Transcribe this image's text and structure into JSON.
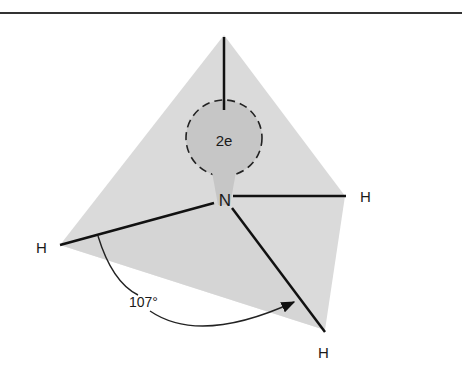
{
  "diagram": {
    "central_atom": "N",
    "lone_pair_label": "2e",
    "hydrogen_labels": [
      "H",
      "H",
      "H"
    ],
    "bond_angle_label": "107°",
    "colors": {
      "tetrahedron_fill": "#d9d9d9",
      "lone_pair_fill": "#c4c4c4",
      "line": "#111111",
      "rule": "#333333"
    }
  }
}
